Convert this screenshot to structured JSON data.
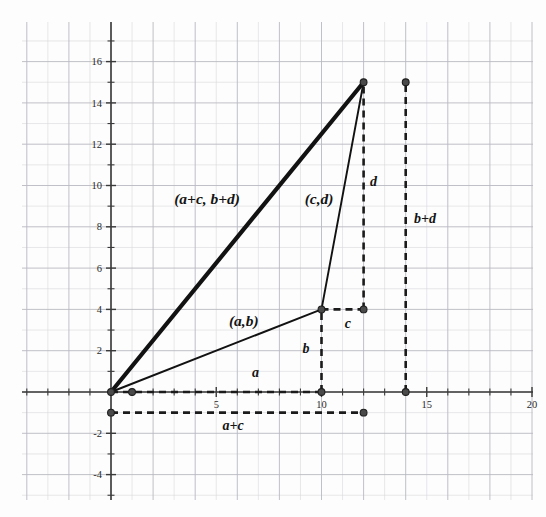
{
  "figure": {
    "background_color": "#fdfdfd",
    "ink_color": "#121212",
    "grid_color": "#d8d8dc"
  },
  "chart_data": {
    "type": "line",
    "title": "",
    "xlabel": "",
    "ylabel": "",
    "xlim": [
      -4.4,
      20.9
    ],
    "ylim": [
      -5.5,
      17.8
    ],
    "grid": true,
    "legend": false,
    "x_ticks": [
      5,
      10,
      15,
      20
    ],
    "x_tick_labels": [
      "5",
      "10",
      "15",
      "20"
    ],
    "y_ticks": [
      -4,
      -2,
      2,
      4,
      6,
      8,
      10,
      12,
      14,
      16
    ],
    "y_tick_labels": [
      "-4",
      "-2",
      "2",
      "4",
      "6",
      "8",
      "10",
      "12",
      "14",
      "16"
    ],
    "points": [
      {
        "name": "origin",
        "x": 0,
        "y": 0
      },
      {
        "name": "a-b",
        "x": 10,
        "y": 4
      },
      {
        "name": "a-plus-c-b-plus-d",
        "x": 12,
        "y": 15
      },
      {
        "name": "a-foot",
        "x": 10,
        "y": 0
      },
      {
        "name": "c-end",
        "x": 12,
        "y": 4
      },
      {
        "name": "a-tick-end",
        "x": 1,
        "y": 0
      },
      {
        "name": "a-plus-c-start",
        "x": 0,
        "y": -1
      },
      {
        "name": "a-plus-c-end",
        "x": 12,
        "y": -1
      },
      {
        "name": "b-plus-d-top",
        "x": 14,
        "y": 15
      },
      {
        "name": "b-plus-d-bottom",
        "x": 14,
        "y": 0
      }
    ],
    "series": [
      {
        "name": "resultant-vector",
        "style": "thick-solid",
        "x": [
          0,
          12
        ],
        "y": [
          0,
          15
        ]
      },
      {
        "name": "vector-a-b",
        "style": "thin-solid",
        "x": [
          0,
          10
        ],
        "y": [
          0,
          4
        ]
      },
      {
        "name": "vector-c-d",
        "style": "thin-solid",
        "x": [
          10,
          12
        ],
        "y": [
          4,
          15
        ]
      },
      {
        "name": "segment-a",
        "style": "dashed",
        "x": [
          0,
          10
        ],
        "y": [
          0,
          0
        ]
      },
      {
        "name": "segment-b",
        "style": "dashed",
        "x": [
          10,
          10
        ],
        "y": [
          0,
          4
        ]
      },
      {
        "name": "segment-c",
        "style": "dashed",
        "x": [
          10,
          12
        ],
        "y": [
          4,
          4
        ]
      },
      {
        "name": "segment-d",
        "style": "dashed",
        "x": [
          12,
          12
        ],
        "y": [
          4,
          15
        ]
      },
      {
        "name": "segment-a-plus-c",
        "style": "dashed",
        "x": [
          0,
          12
        ],
        "y": [
          -1,
          -1
        ]
      },
      {
        "name": "segment-b-plus-d",
        "style": "dashed",
        "x": [
          14,
          14
        ],
        "y": [
          0,
          15
        ]
      }
    ],
    "annotations": [
      {
        "name": "label-a-plus-c-b-plus-d",
        "text": "(a+c, b+d)",
        "x": 3.0,
        "y": 9.1
      },
      {
        "name": "label-c-d",
        "text": "(c,d)",
        "x": 9.2,
        "y": 9.1
      },
      {
        "name": "label-a-b",
        "text": "(a,b)",
        "x": 5.6,
        "y": 3.2
      },
      {
        "name": "label-d",
        "text": "d",
        "x": 12.3,
        "y": 10.0
      },
      {
        "name": "label-b-plus-d",
        "text": "b+d",
        "x": 14.4,
        "y": 8.2
      },
      {
        "name": "label-c",
        "text": "c",
        "x": 11.1,
        "y": 3.1
      },
      {
        "name": "label-b",
        "text": "b",
        "x": 9.1,
        "y": 1.9
      },
      {
        "name": "label-a",
        "text": "a",
        "x": 6.7,
        "y": 0.75
      },
      {
        "name": "label-a-plus-c",
        "text": "a+c",
        "x": 5.3,
        "y": -1.85
      }
    ]
  }
}
